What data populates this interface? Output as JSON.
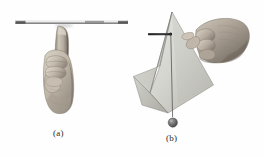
{
  "figure": {
    "background_color": "#fefefe",
    "panels": [
      {
        "id": "a",
        "caption": "(a)",
        "description": "A hand in a fist with the index finger extended upward, balancing a thin rod horizontally on the fingertip",
        "objects": [
          {
            "name": "balanced-rod",
            "type": "rod",
            "orientation": "horizontal",
            "color": "#8a8a8a",
            "end_cap_color": "#4a4a4a"
          },
          {
            "name": "supporting-hand",
            "type": "hand",
            "pose": "fist-with-index-finger-up",
            "skin_color": "#b9b2a8"
          }
        ]
      },
      {
        "id": "b",
        "caption": "(b)",
        "description": "A hand holding an irregular flat plate by a pivot pin near its top-left, with a plumb line and bob hanging vertically from the pivot",
        "objects": [
          {
            "name": "irregular-plate",
            "type": "plate",
            "shape": "irregular-polygon",
            "fill_color": "#d8d8d2",
            "edge_color": "#7c7c78"
          },
          {
            "name": "pivot-pin",
            "type": "pin",
            "orientation": "horizontal",
            "color": "#2e2e2e"
          },
          {
            "name": "plumb-line",
            "type": "line",
            "orientation": "vertical",
            "color": "#555555"
          },
          {
            "name": "plumb-bob",
            "type": "weight",
            "shape": "circle",
            "color": "#6e6e6e"
          },
          {
            "name": "holding-hand",
            "type": "hand",
            "pose": "fist-gripping-pin",
            "skin_color": "#b0a89e"
          }
        ]
      }
    ]
  }
}
